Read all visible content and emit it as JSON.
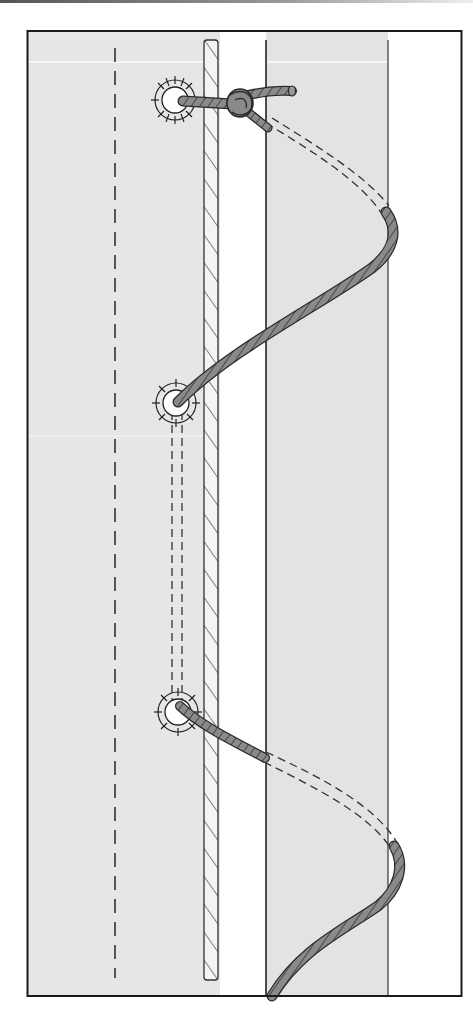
{
  "colors": {
    "frame": "#1a1a1a",
    "sail_panel": "#e6e6e6",
    "gap": "#ffffff",
    "lacing_rope": "#8a8a8a",
    "lacing_outline": "#2a2a2a",
    "bolt_rope_fill": "#f2f2f2",
    "dash": "#333333"
  },
  "elements": {
    "eyelets": [
      {
        "name": "top-eyelet",
        "cx": 175,
        "cy": 100
      },
      {
        "name": "middle-eyelet",
        "cx": 176,
        "cy": 403
      },
      {
        "name": "bottom-eyelet",
        "cx": 178,
        "cy": 712
      }
    ],
    "knot": {
      "name": "top-knot",
      "cx": 240,
      "cy": 102
    },
    "stitch_line_x": 115
  }
}
